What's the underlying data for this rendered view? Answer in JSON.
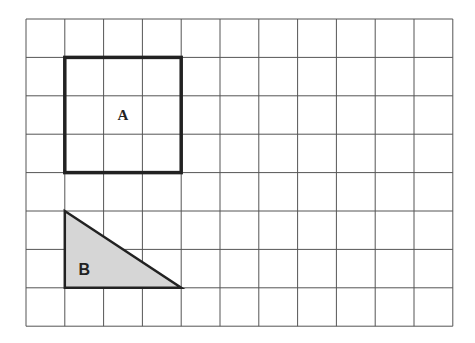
{
  "grid": {
    "cols": 11,
    "rows": 8,
    "x0": 26,
    "y0": 19,
    "cell_w": 38.8,
    "cell_h": 38.4,
    "line_color": "#555555"
  },
  "shapes": {
    "square_a": {
      "label": "A",
      "col": 1,
      "row": 1,
      "size": 3,
      "stroke": "#222222"
    },
    "triangle_b": {
      "label": "B",
      "vertices": [
        [
          1,
          5
        ],
        [
          1,
          7
        ],
        [
          4,
          7
        ]
      ],
      "fill": "#d6d6d6",
      "stroke": "#222222"
    }
  }
}
